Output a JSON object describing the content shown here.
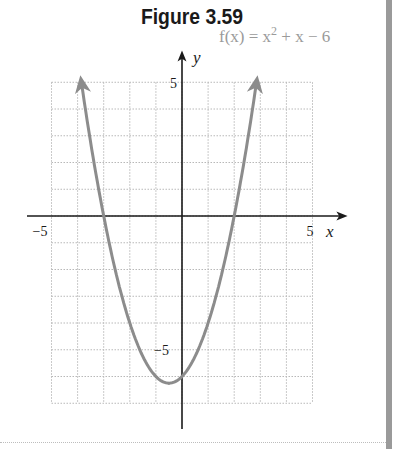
{
  "figure": {
    "title": "Figure 3.59"
  },
  "chart_data": {
    "type": "line",
    "title": "Figure 3.59",
    "function_label": "f(x) = x² + x − 6",
    "function_parts": {
      "lhs": "f(x) = x",
      "exp": "2",
      "rhs": " + x − 6"
    },
    "xlabel": "x",
    "ylabel": "y",
    "xlim": [
      -5,
      5
    ],
    "ylim": [
      -7,
      5
    ],
    "x_tick_labels": [
      {
        "value": -5,
        "label": "−5"
      },
      {
        "value": 5,
        "label": "5"
      }
    ],
    "y_tick_labels": [
      {
        "value": 5,
        "label": "5"
      },
      {
        "value": -5,
        "label": "−5"
      }
    ],
    "grid": true,
    "grid_step": 1,
    "curve_color": "#8c8c8c",
    "series": [
      {
        "name": "f(x) = x^2 + x - 6",
        "x": [
          -3.854,
          -3.5,
          -3,
          -2.5,
          -2,
          -1.5,
          -1,
          -0.5,
          0,
          0.5,
          1,
          1.5,
          2,
          2.5,
          2.854
        ],
        "y": [
          5,
          2.75,
          0,
          -2.25,
          -4,
          -5.25,
          -6,
          -6.25,
          -6,
          -5.25,
          -4,
          -2.25,
          0,
          2.75,
          5
        ]
      }
    ],
    "key_points": {
      "x_intercepts": [
        -3,
        2
      ],
      "y_intercept": -6,
      "vertex": [
        -0.5,
        -6.25
      ]
    },
    "arrows_on_curve_ends": true
  }
}
